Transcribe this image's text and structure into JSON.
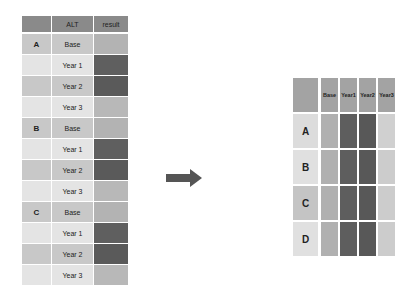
{
  "colors": {
    "header": "#8a8a8a",
    "light": "#e4e4e4",
    "mid": "#c4c4c4",
    "result_light": "#b8b8b8",
    "result_dark": "#5e5e5e",
    "arrow": "#555555"
  },
  "left_table": {
    "headers": [
      "",
      "ALT",
      "result"
    ],
    "rows": [
      {
        "group": "A",
        "alt": "Base",
        "label_bg": "#c8c8c8",
        "alt_bg": "#c8c8c8",
        "result": "#b3b3b3"
      },
      {
        "group": "",
        "alt": "Year 1",
        "label_bg": "#e4e4e4",
        "alt_bg": "#e4e4e4",
        "result": "#5f5f5f"
      },
      {
        "group": "",
        "alt": "Year 2",
        "label_bg": "#c8c8c8",
        "alt_bg": "#c8c8c8",
        "result": "#5a5a5a"
      },
      {
        "group": "",
        "alt": "Year 3",
        "label_bg": "#e4e4e4",
        "alt_bg": "#e4e4e4",
        "result": "#b8b8b8"
      },
      {
        "group": "B",
        "alt": "Base",
        "label_bg": "#c8c8c8",
        "alt_bg": "#c8c8c8",
        "result": "#b3b3b3"
      },
      {
        "group": "",
        "alt": "Year 1",
        "label_bg": "#e4e4e4",
        "alt_bg": "#e4e4e4",
        "result": "#5f5f5f"
      },
      {
        "group": "",
        "alt": "Year 2",
        "label_bg": "#c8c8c8",
        "alt_bg": "#c8c8c8",
        "result": "#5a5a5a"
      },
      {
        "group": "",
        "alt": "Year 3",
        "label_bg": "#e4e4e4",
        "alt_bg": "#e4e4e4",
        "result": "#b8b8b8"
      },
      {
        "group": "C",
        "alt": "Base",
        "label_bg": "#c8c8c8",
        "alt_bg": "#c8c8c8",
        "result": "#b3b3b3"
      },
      {
        "group": "",
        "alt": "Year 1",
        "label_bg": "#e4e4e4",
        "alt_bg": "#e4e4e4",
        "result": "#5f5f5f"
      },
      {
        "group": "",
        "alt": "Year 2",
        "label_bg": "#c8c8c8",
        "alt_bg": "#c8c8c8",
        "result": "#5a5a5a"
      },
      {
        "group": "",
        "alt": "Year 3",
        "label_bg": "#e4e4e4",
        "alt_bg": "#e4e4e4",
        "result": "#b8b8b8"
      }
    ]
  },
  "arrow": {
    "direction": "right"
  },
  "right_table": {
    "headers": [
      "",
      "Base",
      "Year 1",
      "Year 2",
      "Year 3"
    ],
    "header_lines": [
      [
        ""
      ],
      [
        "Base"
      ],
      [
        "Year",
        "1"
      ],
      [
        "Year",
        "2"
      ],
      [
        "Year",
        "3"
      ]
    ],
    "rows": [
      {
        "label": "A",
        "label_bg": "#dcdcdc",
        "cells": [
          "#b0b0b0",
          "#5e5e5e",
          "#585858",
          "#d0d0d0"
        ]
      },
      {
        "label": "B",
        "label_bg": "#e0e0e0",
        "cells": [
          "#b0b0b0",
          "#5e5e5e",
          "#585858",
          "#cccccc"
        ]
      },
      {
        "label": "C",
        "label_bg": "#c4c4c4",
        "cells": [
          "#b0b0b0",
          "#5e5e5e",
          "#585858",
          "#cccccc"
        ]
      },
      {
        "label": "D",
        "label_bg": "#e0e0e0",
        "cells": [
          "#b0b0b0",
          "#5e5e5e",
          "#585858",
          "#cccccc"
        ]
      }
    ]
  }
}
